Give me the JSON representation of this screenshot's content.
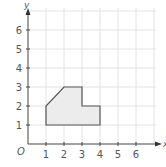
{
  "axes": {
    "x_label": "x",
    "y_label": "y",
    "origin_label": "O",
    "x_ticks": [
      "1",
      "2",
      "3",
      "4",
      "5",
      "6"
    ],
    "y_ticks": [
      "1",
      "2",
      "3",
      "4",
      "5",
      "6"
    ]
  },
  "shape": {
    "vertices": [
      [
        1,
        1
      ],
      [
        1,
        2
      ],
      [
        2,
        3
      ],
      [
        3,
        3
      ],
      [
        3,
        2
      ],
      [
        4,
        2
      ],
      [
        4,
        1
      ]
    ],
    "fill": "#ececec",
    "stroke": "#555555"
  },
  "grid": {
    "xmax": 7,
    "ymax": 7,
    "color": "#e2e2e2"
  },
  "chart_data": {
    "type": "polygon-on-grid",
    "title": "",
    "xlabel": "x",
    "ylabel": "y",
    "xlim": [
      0,
      7
    ],
    "ylim": [
      0,
      7
    ],
    "grid": true,
    "x_tick_labels": [
      "1",
      "2",
      "3",
      "4",
      "5",
      "6"
    ],
    "y_tick_labels": [
      "1",
      "2",
      "3",
      "4",
      "5",
      "6"
    ],
    "polygon": [
      [
        1,
        1
      ],
      [
        1,
        2
      ],
      [
        2,
        3
      ],
      [
        3,
        3
      ],
      [
        3,
        2
      ],
      [
        4,
        2
      ],
      [
        4,
        1
      ]
    ]
  }
}
